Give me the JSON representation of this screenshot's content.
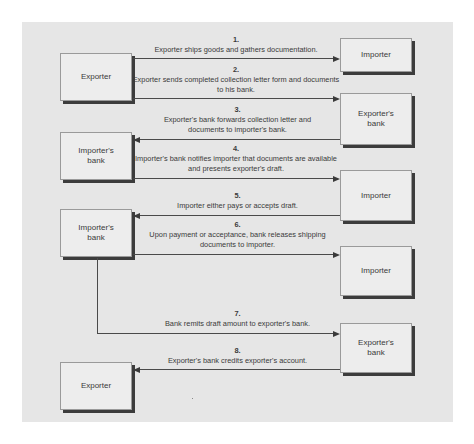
{
  "diagram": {
    "boxes": {
      "exporter_top": "Exporter",
      "importer_1": "Importer",
      "exporters_bank_1": "Exporter's bank",
      "importers_bank_1": "Importer's bank",
      "importer_2": "Importer",
      "importers_bank_2": "Importer's bank",
      "importer_3": "Importer",
      "exporters_bank_2": "Exporter's bank",
      "exporter_bottom": "Exporter"
    },
    "steps": [
      {
        "num": "1.",
        "text": "Exporter ships goods and gathers documentation.",
        "from": "Exporter",
        "to": "Importer"
      },
      {
        "num": "2.",
        "text": "Exporter sends completed collection letter form and documents to his bank.",
        "from": "Exporter",
        "to": "Exporter's bank"
      },
      {
        "num": "3.",
        "text": "Exporter's bank forwards collection letter and documents to importer's bank.",
        "from": "Exporter's bank",
        "to": "Importer's bank"
      },
      {
        "num": "4.",
        "text": "Importer's bank notifies importer that documents are available and presents exporter's draft.",
        "from": "Importer's bank",
        "to": "Importer"
      },
      {
        "num": "5.",
        "text": "Importer either pays or accepts draft.",
        "from": "Importer",
        "to": "Importer's bank"
      },
      {
        "num": "6.",
        "text": "Upon payment or acceptance, bank releases shipping documents to importer.",
        "from": "Importer's bank",
        "to": "Importer"
      },
      {
        "num": "7.",
        "text": "Bank remits draft amount to exporter's bank.",
        "from": "Importer's bank",
        "to": "Exporter's bank"
      },
      {
        "num": "8.",
        "text": "Exporter's bank credits exporter's account.",
        "from": "Exporter's bank",
        "to": "Exporter"
      }
    ]
  },
  "colors": {
    "panel": "#e6e6e6",
    "box": "#ededed",
    "line": "#4a4a4a",
    "shadow": "#3c3c3c"
  }
}
